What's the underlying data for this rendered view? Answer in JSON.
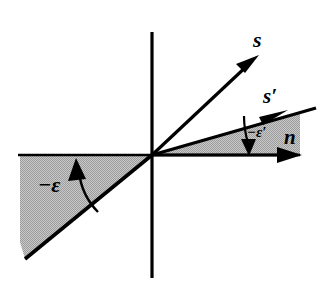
{
  "figure": {
    "background_color": "#ffffff",
    "line_color": "#000000",
    "shade_color": "#b5b5b5",
    "width": 334,
    "height": 287,
    "origin": {
      "x": 152,
      "y": 155
    }
  },
  "axes": {
    "vertical": {
      "name": "vertical-axis",
      "x": 152,
      "y_top": 32,
      "y_bottom": 278
    },
    "horizontal": {
      "name": "horizontal-axis",
      "y": 155,
      "x_left": 18,
      "x_right": 300
    }
  },
  "labels": {
    "s": "s",
    "s_prime": "s′",
    "n": "n",
    "minus_epsilon": "−ε",
    "minus_epsilon_prime": "−ε′"
  },
  "vectors": [
    {
      "name": "s-vector",
      "label": "s",
      "from": {
        "x": 152,
        "y": 155
      },
      "to": {
        "x": 257,
        "y": 57
      },
      "arrowhead": true,
      "angle_deg": 43
    },
    {
      "name": "s-prime-vector",
      "label": "s′",
      "from": {
        "x": 152,
        "y": 155
      },
      "to": {
        "x": 316,
        "y": 108
      },
      "arrowhead": true,
      "angle_deg": 16
    },
    {
      "name": "n-vector",
      "label": "n",
      "from": {
        "x": 152,
        "y": 155
      },
      "to": {
        "x": 300,
        "y": 155
      },
      "arrowhead": true,
      "angle_deg": 0
    },
    {
      "name": "epsilon-ray",
      "label": "−ε",
      "from": {
        "x": 152,
        "y": 155
      },
      "to": {
        "x": 25,
        "y": 259
      },
      "arrowhead": false,
      "angle_deg": -39
    }
  ],
  "shaded_regions": [
    {
      "name": "epsilon-wedge",
      "description": "Shaded wedge between negative horizontal axis and the epsilon ray",
      "color": "#b5b5b5"
    },
    {
      "name": "epsilon-prime-wedge",
      "description": "Shaded wedge between positive horizontal axis and the s-prime vector",
      "color": "#b5b5b5"
    }
  ],
  "angle_arcs": [
    {
      "name": "epsilon-angle-arc",
      "label": "−ε",
      "direction": "counterclockwise-up",
      "arrowhead": true
    },
    {
      "name": "epsilon-prime-angle-arc",
      "label": "−ε′",
      "direction": "clockwise-down",
      "arrowhead": true
    }
  ]
}
